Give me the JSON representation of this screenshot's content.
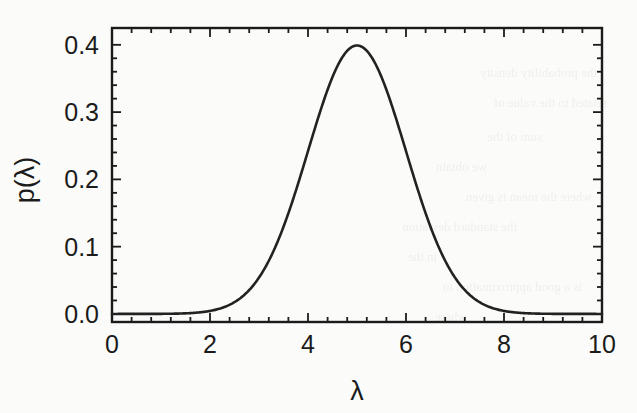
{
  "figure": {
    "ylabel": "p(λ)",
    "xlabel": "λ",
    "xticklabels": [
      "0",
      "2",
      "4",
      "6",
      "8",
      "10"
    ],
    "yticklabels": [
      "0.0",
      "0.1",
      "0.2",
      "0.3",
      "0.4"
    ],
    "line_color": "#222222",
    "frame_color": "#1b1b1b",
    "background_color": "#fbfbfa"
  },
  "ghost_text": {
    "lines": [
      "the probability density",
      "related to the value of",
      "sum of the",
      "we obtain",
      "where the mean is given",
      "the standard deviation",
      "in the",
      "is a good approximation to",
      "where"
    ]
  },
  "chart_data": {
    "type": "line",
    "title": "",
    "xlabel": "λ",
    "ylabel": "p(λ)",
    "xlim": [
      0,
      10
    ],
    "ylim": [
      -0.012,
      0.425
    ],
    "xticks": [
      0,
      2,
      4,
      6,
      8,
      10
    ],
    "yticks": [
      0.0,
      0.1,
      0.2,
      0.3,
      0.4
    ],
    "x_minor_tick_interval": 0.4,
    "y_minor_tick_interval": 0.02,
    "grid": false,
    "legend": null,
    "ticks_direction": "in",
    "ticks_on_all_sides": true,
    "distribution": "gaussian",
    "mean": 5.0,
    "sigma": 1.0,
    "peak_value": 0.399,
    "peak_x": 5.0,
    "series": [
      {
        "name": "p(λ)",
        "color": "#222222",
        "linewidth": 2.6,
        "x": [
          0.0,
          0.25,
          0.5,
          0.75,
          1.0,
          1.25,
          1.5,
          1.75,
          2.0,
          2.25,
          2.5,
          2.75,
          3.0,
          3.25,
          3.5,
          3.75,
          4.0,
          4.25,
          4.5,
          4.75,
          5.0,
          5.25,
          5.5,
          5.75,
          6.0,
          6.25,
          6.5,
          6.75,
          7.0,
          7.25,
          7.5,
          7.75,
          8.0,
          8.25,
          8.5,
          8.75,
          9.0,
          9.25,
          9.5,
          9.75,
          10.0
        ],
        "y": [
          0.0,
          0.0,
          0.0,
          0.0,
          0.0001,
          0.0002,
          0.0004,
          0.0009,
          0.0044,
          0.0091,
          0.0175,
          0.031,
          0.054,
          0.0863,
          0.1295,
          0.1826,
          0.242,
          0.3011,
          0.3521,
          0.3867,
          0.3989,
          0.3867,
          0.3521,
          0.3011,
          0.242,
          0.1826,
          0.1295,
          0.0863,
          0.054,
          0.031,
          0.0175,
          0.0091,
          0.0044,
          0.002,
          0.0009,
          0.0004,
          0.0002,
          0.0001,
          0.0,
          0.0,
          0.0
        ]
      }
    ]
  }
}
